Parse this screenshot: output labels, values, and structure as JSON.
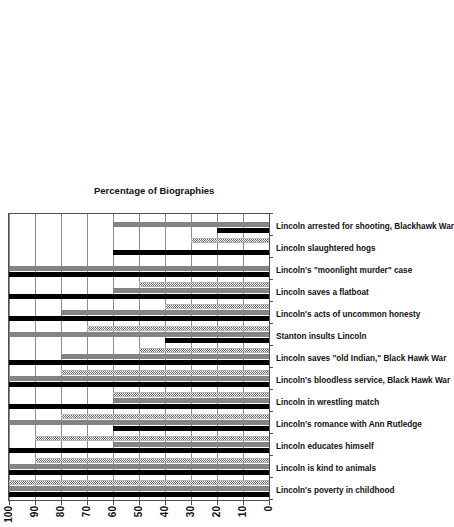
{
  "chart_data": {
    "type": "bar",
    "orientation": "horizontal",
    "title": "",
    "xlabel": "Percentage of Biographies",
    "ylabel": "",
    "xlim": [
      0,
      100
    ],
    "xticks": [
      0,
      10,
      20,
      30,
      40,
      50,
      60,
      70,
      80,
      90,
      100
    ],
    "grid": true,
    "legend_position": "none",
    "categories": [
      "Lincoln's poverty in childhood",
      "Lincoln is kind to animals",
      "Lincoln educates himself",
      "Lincoln's romance with Ann Rutledge",
      "Lincoln in wrestling match",
      "Lincoln's bloodless service, Black Hawk War",
      "Lincoln saves \"old Indian,\" Black Hawk War",
      "Stanton insults Lincoln",
      "Lincoln's acts of uncommon honesty",
      "Lincoln saves a flatboat",
      "Lincoln's \"moonlight murder\" case",
      "Lincoln slaughtered hogs",
      "Lincoln arrested for shooting, Blackhawk War"
    ],
    "series": [
      {
        "name": "Series 1",
        "pattern": "solid-black",
        "color": "#000000",
        "values": [
          100,
          100,
          100,
          60,
          100,
          100,
          100,
          40,
          100,
          100,
          100,
          60,
          20
        ]
      },
      {
        "name": "Series 2",
        "pattern": "solid-gray",
        "color": "#848484",
        "values": [
          100,
          100,
          60,
          100,
          60,
          100,
          80,
          100,
          80,
          60,
          100,
          0,
          60
        ]
      },
      {
        "name": "Series 3",
        "pattern": "stippled-light",
        "color": "#b5b5b5",
        "values": [
          100,
          90,
          90,
          80,
          60,
          80,
          50,
          70,
          40,
          50,
          0,
          30,
          0
        ]
      }
    ]
  }
}
